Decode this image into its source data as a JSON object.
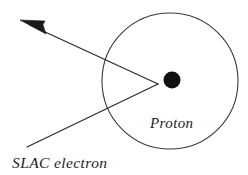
{
  "diagram": {
    "background_color": "#ffffff",
    "stroke_color": "#2b2b2b",
    "nucleus_color": "#111111",
    "labels": {
      "proton": "Proton",
      "electron": "SLAC electron"
    },
    "shapes": {
      "atom_circle": {
        "name": "atom-boundary-circle",
        "cx": 170,
        "cy": 81,
        "r": 68,
        "filled": false
      },
      "nucleus": {
        "name": "proton-nucleus-dot",
        "cx": 172,
        "cy": 80,
        "r": 8.5,
        "filled": true
      },
      "incoming_path": {
        "name": "incoming-electron-track",
        "from_x": 27,
        "from_y": 147,
        "to_x": 158,
        "to_y": 84
      },
      "outgoing_path": {
        "name": "scattered-electron-track",
        "from_x": 158,
        "from_y": 84,
        "to_x": 27,
        "to_y": 24
      },
      "arrow_head": {
        "name": "scattered-direction-arrowhead",
        "tip_x": 20,
        "tip_y": 20,
        "length": 24,
        "half_width": 4
      }
    },
    "label_positions": {
      "proton": {
        "x": 150,
        "y": 128
      },
      "electron": {
        "x": 12,
        "y": 168
      }
    }
  }
}
